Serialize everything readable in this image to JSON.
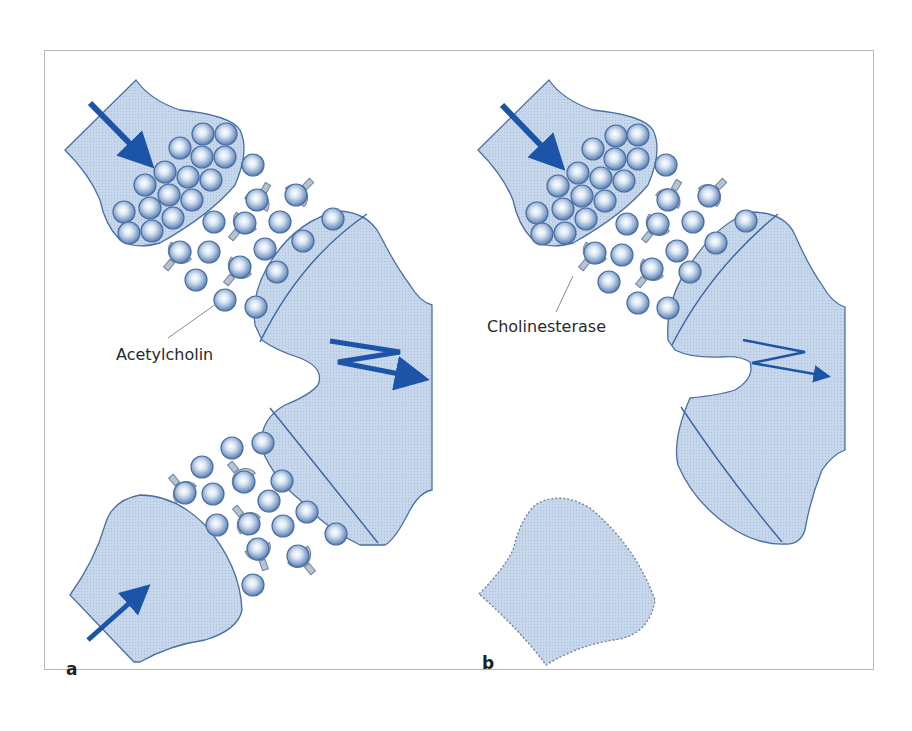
{
  "figure": {
    "panels": [
      {
        "letter": "a",
        "label": "Acetylcholin",
        "state": "two active presynaptic terminals releasing acetylcholine; strong postsynaptic excitation"
      },
      {
        "letter": "b",
        "label": "Cholinesterase",
        "state": "one presynaptic terminal inactive (dashed outline); weak postsynaptic excitation"
      }
    ],
    "colors": {
      "membrane_fill": "#c5d6ea",
      "membrane_stroke": "#3b64a8",
      "arrow": "#1c55a8",
      "vesicle_light": "#f4f8fd",
      "vesicle_dark": "#5a82b8",
      "enzyme_fill": "#b4c2d4",
      "enzyme_stroke": "#6c7f99",
      "leader_line": "#8a8a8a",
      "frame": "#b8b8b8"
    },
    "icons": {
      "input_arrow": "straight-arrow",
      "excitation_arrow": "zigzag-lightning-arrow"
    }
  }
}
